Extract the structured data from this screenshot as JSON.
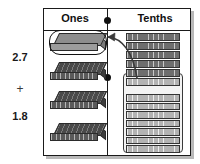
{
  "diagram": {
    "type": "place-value-regrouping"
  },
  "operands": {
    "top": "2.7",
    "operator": "+",
    "bottom": "1.8"
  },
  "columns": [
    {
      "id": "ones",
      "label": "Ones"
    },
    {
      "id": "tenths",
      "label": "Tenths"
    }
  ],
  "decimal_point": {
    "glyph": "●",
    "count": 2,
    "color": "#111111"
  },
  "ones_blocks": [
    {
      "index": 0,
      "kind": "flat-slab",
      "state": "regrouped-highlighted",
      "fill": "#8d8d8d",
      "circled": true
    },
    {
      "index": 1,
      "kind": "flat-slab",
      "state": "normal",
      "fill": "#4a4a4a",
      "circled": false
    },
    {
      "index": 2,
      "kind": "flat-slab",
      "state": "normal",
      "fill": "#4a4a4a",
      "circled": false
    },
    {
      "index": 3,
      "kind": "flat-slab",
      "state": "normal",
      "fill": "#4a4a4a",
      "circled": false
    }
  ],
  "tenths_rods": [
    {
      "index": 0,
      "group": "loose",
      "shade": "dark"
    },
    {
      "index": 1,
      "group": "loose",
      "shade": "dark"
    },
    {
      "index": 2,
      "group": "loose",
      "shade": "dark"
    },
    {
      "index": 3,
      "group": "loose",
      "shade": "dark"
    },
    {
      "index": 4,
      "group": "loose",
      "shade": "dark"
    },
    {
      "index": 5,
      "group": "grouped",
      "shade": "light"
    },
    {
      "index": 6,
      "group": "grouped",
      "shade": "light"
    },
    {
      "index": 7,
      "group": "grouped",
      "shade": "light"
    },
    {
      "index": 8,
      "group": "grouped",
      "shade": "light"
    },
    {
      "index": 9,
      "group": "grouped",
      "shade": "light"
    },
    {
      "index": 10,
      "group": "grouped",
      "shade": "light"
    },
    {
      "index": 11,
      "group": "grouped",
      "shade": "light"
    },
    {
      "index": 12,
      "group": "grouped",
      "shade": "light"
    },
    {
      "index": 13,
      "group": "grouped",
      "shade": "light"
    },
    {
      "index": 14,
      "group": "grouped",
      "shade": "light"
    }
  ],
  "arrow": {
    "name": "regroup-arrow",
    "from": "tenths-group-box",
    "to": "ones-highlighted-slab",
    "direction": "right-to-left",
    "color": "#3a3a3a"
  },
  "colors": {
    "frame": "#1a1a1a",
    "shadow": "#b9b9b9",
    "block_dark": "#4a4a4a",
    "block_light": "#8d8d8d",
    "rod_dark": "#6e6e6e",
    "rod_light": "#b3b3b3",
    "text": "#111111",
    "background": "#ffffff"
  }
}
